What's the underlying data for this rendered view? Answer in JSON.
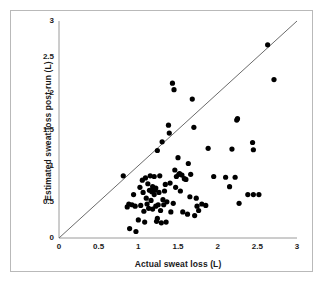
{
  "chart_data": {
    "type": "scatter",
    "title": "",
    "xlabel": "Actual sweat loss (L)",
    "ylabel": "Estimated sweat loss post-run (L)",
    "xlim": [
      0,
      3
    ],
    "ylim": [
      0,
      3
    ],
    "xticks": [
      "0",
      "0.5",
      "1",
      "1.5",
      "2",
      "2.5",
      "3"
    ],
    "xtick_values": [
      0,
      0.5,
      1,
      1.5,
      2,
      2.5,
      3
    ],
    "yticks": [
      "0",
      "0.5",
      "1",
      "1.5",
      "2",
      "2.5",
      "3"
    ],
    "ytick_values": [
      0,
      0.5,
      1,
      1.5,
      2,
      2.5,
      3
    ],
    "grid": false,
    "legend": null,
    "marker": {
      "shape": "circle",
      "color": "#000000",
      "size_px": 5.2
    },
    "reference_line": {
      "name": "line-of-identity",
      "from": [
        0,
        0
      ],
      "to": [
        3,
        3
      ],
      "color": "#6b6b6b",
      "width_px": 1
    },
    "points": [
      [
        0.81,
        0.86
      ],
      [
        0.86,
        0.43
      ],
      [
        0.88,
        0.47
      ],
      [
        0.89,
        0.13
      ],
      [
        0.92,
        0.46
      ],
      [
        0.94,
        0.6
      ],
      [
        0.96,
        0.44
      ],
      [
        0.97,
        0.09
      ],
      [
        1.0,
        0.25
      ],
      [
        1.02,
        0.7
      ],
      [
        1.03,
        0.45
      ],
      [
        1.05,
        0.8
      ],
      [
        1.06,
        0.63
      ],
      [
        1.07,
        0.37
      ],
      [
        1.08,
        0.22
      ],
      [
        1.09,
        0.83
      ],
      [
        1.1,
        0.55
      ],
      [
        1.11,
        0.47
      ],
      [
        1.12,
        0.75
      ],
      [
        1.13,
        0.41
      ],
      [
        1.14,
        0.66
      ],
      [
        1.15,
        0.86
      ],
      [
        1.16,
        0.52
      ],
      [
        1.17,
        0.64
      ],
      [
        1.18,
        0.71
      ],
      [
        1.18,
        0.4
      ],
      [
        1.19,
        0.68
      ],
      [
        1.2,
        0.85
      ],
      [
        1.2,
        0.6
      ],
      [
        1.21,
        0.66
      ],
      [
        1.22,
        0.69
      ],
      [
        1.22,
        0.44
      ],
      [
        1.23,
        0.23
      ],
      [
        1.24,
        0.27
      ],
      [
        1.25,
        0.46
      ],
      [
        1.26,
        0.63
      ],
      [
        1.27,
        0.86
      ],
      [
        1.28,
        0.38
      ],
      [
        1.29,
        0.21
      ],
      [
        1.3,
        1.33
      ],
      [
        1.31,
        0.53
      ],
      [
        1.32,
        0.46
      ],
      [
        1.33,
        0.65
      ],
      [
        1.34,
        0.74
      ],
      [
        1.35,
        0.22
      ],
      [
        1.36,
        0.5
      ],
      [
        1.24,
        1.21
      ],
      [
        1.38,
        1.56
      ],
      [
        1.39,
        1.45
      ],
      [
        1.4,
        0.76
      ],
      [
        1.41,
        0.36
      ],
      [
        1.43,
        2.14
      ],
      [
        1.45,
        2.05
      ],
      [
        1.44,
        0.48
      ],
      [
        1.46,
        0.94
      ],
      [
        1.47,
        0.7
      ],
      [
        1.48,
        0.85
      ],
      [
        1.5,
        1.11
      ],
      [
        1.51,
        0.88
      ],
      [
        1.52,
        0.89
      ],
      [
        1.53,
        0.65
      ],
      [
        1.55,
        0.87
      ],
      [
        1.56,
        0.36
      ],
      [
        1.58,
        0.82
      ],
      [
        1.6,
        0.81
      ],
      [
        1.62,
        0.33
      ],
      [
        1.63,
        1.03
      ],
      [
        1.65,
        0.57
      ],
      [
        1.66,
        0.88
      ],
      [
        1.68,
        1.92
      ],
      [
        1.7,
        1.53
      ],
      [
        1.71,
        0.31
      ],
      [
        1.73,
        0.55
      ],
      [
        1.74,
        0.44
      ],
      [
        1.76,
        0.38
      ],
      [
        1.8,
        0.47
      ],
      [
        1.85,
        0.45
      ],
      [
        1.88,
        1.24
      ],
      [
        1.95,
        0.85
      ],
      [
        2.1,
        0.84
      ],
      [
        2.15,
        0.71
      ],
      [
        2.18,
        1.23
      ],
      [
        2.22,
        0.84
      ],
      [
        2.24,
        1.63
      ],
      [
        2.25,
        1.65
      ],
      [
        2.27,
        0.48
      ],
      [
        2.38,
        0.6
      ],
      [
        2.44,
        1.32
      ],
      [
        2.45,
        1.22
      ],
      [
        2.45,
        0.6
      ],
      [
        2.52,
        0.6
      ],
      [
        2.63,
        2.67
      ],
      [
        2.71,
        2.19
      ]
    ]
  }
}
